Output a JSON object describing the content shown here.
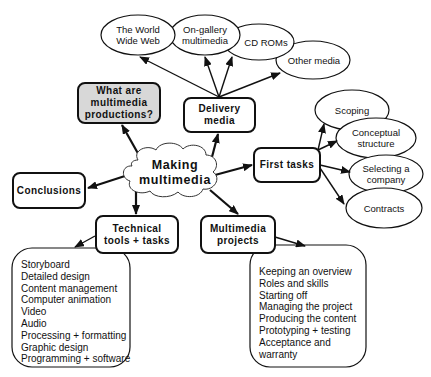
{
  "diagram": {
    "center": {
      "label_line1": "Making",
      "label_line2": "multimedia"
    },
    "what_are": {
      "line1": "What are",
      "line2": "multimedia",
      "line3": "productions?"
    },
    "delivery": {
      "line1": "Delivery",
      "line2": "media",
      "children": [
        {
          "line1": "The World",
          "line2": "Wide Web"
        },
        {
          "line1": "On-gallery",
          "line2": "multimedia"
        },
        {
          "line1": "CD ROMs",
          "line2": ""
        },
        {
          "line1": "Other media",
          "line2": ""
        }
      ]
    },
    "first_tasks": {
      "label": "First tasks",
      "children": [
        {
          "line1": "Scoping",
          "line2": ""
        },
        {
          "line1": "Conceptual",
          "line2": "structure"
        },
        {
          "line1": "Selecting a",
          "line2": "company"
        },
        {
          "line1": "Contracts",
          "line2": ""
        }
      ]
    },
    "conclusions": {
      "label": "Conclusions"
    },
    "technical": {
      "line1": "Technical",
      "line2": "tools + tasks",
      "items": [
        "Storyboard",
        "Detailed design",
        "Content management",
        "Computer animation",
        "Video",
        "Audio",
        "Processing + formatting",
        "Graphic design",
        "Programming + software"
      ]
    },
    "projects": {
      "line1": "Multimedia",
      "line2": "projects",
      "items": [
        "Keeping an overview",
        "Roles and skills",
        "Starting off",
        "Managing the project",
        "Producing the content",
        "Prototyping + testing",
        "Acceptance and",
        "warranty"
      ]
    },
    "colors": {
      "stroke": "#111111",
      "highlight_fill": "#d8d8d8",
      "background": "#ffffff"
    }
  }
}
